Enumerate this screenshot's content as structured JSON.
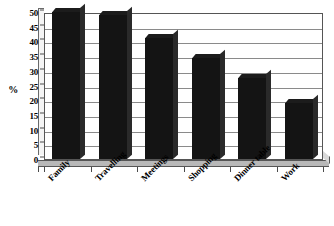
{
  "chart_data": {
    "type": "bar",
    "title": "",
    "subtitle": "",
    "xlabel": "",
    "ylabel": "%",
    "categories": [
      "Family",
      "Travelling",
      "Meetings",
      "Shopping",
      "Dinner table",
      "Work"
    ],
    "values": [
      50,
      49,
      41,
      34.5,
      27.5,
      19
    ],
    "series": [
      {
        "name": "",
        "values": [
          50,
          49,
          41,
          34.5,
          27.5,
          19
        ]
      }
    ],
    "ylim": [
      0,
      50
    ],
    "y_ticks": [
      0,
      5,
      10,
      15,
      20,
      25,
      30,
      35,
      40,
      45,
      50
    ],
    "y_tick_labels": [
      "0",
      "5",
      "10",
      "15",
      "20",
      "25",
      "30",
      "35",
      "40",
      "45",
      "50"
    ],
    "grid": true,
    "grid_axis": "y",
    "legend": false,
    "legend_position": "none",
    "bar_color": "#141414",
    "grid_color": "#8a8a8a",
    "axis_color": "#555555",
    "background_color": "#ffffff",
    "annotations": [],
    "style": "3d-column"
  },
  "axes": {
    "y_title": "%"
  }
}
